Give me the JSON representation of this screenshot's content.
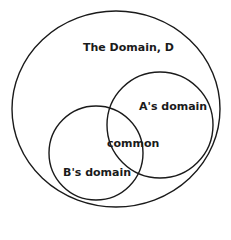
{
  "diagram": {
    "type": "venn",
    "stroke_color": "#1a1a1a",
    "background": "#ffffff",
    "sets": [
      {
        "id": "domain",
        "label": "The Domain, D",
        "shape": "ellipse",
        "cx": 116,
        "cy": 109,
        "rx": 104,
        "ry": 98
      },
      {
        "id": "a",
        "label": "A's domain",
        "shape": "circle",
        "cx": 160,
        "cy": 125,
        "r": 53
      },
      {
        "id": "b",
        "label": "B's domain",
        "shape": "circle",
        "cx": 96,
        "cy": 153,
        "r": 47
      }
    ],
    "intersection_label": "common"
  },
  "labels": {
    "domain": "The Domain, D",
    "a": "A's domain",
    "b": "B's domain",
    "common": "common"
  }
}
